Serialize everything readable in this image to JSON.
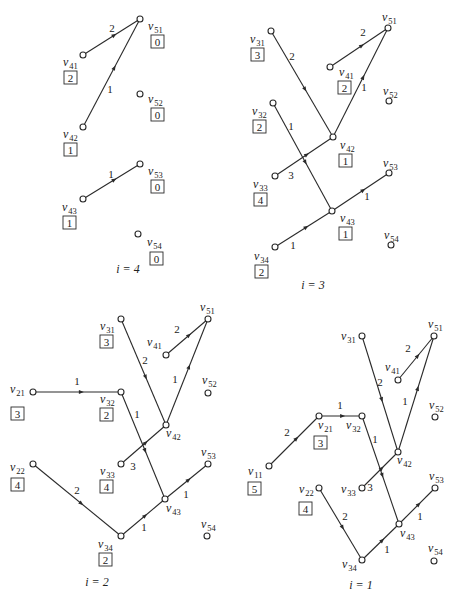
{
  "panels": [
    {
      "id": "i4",
      "caption": "i = 4",
      "caption_pos": [
        128,
        273
      ],
      "nodes": [
        {
          "name": "v51",
          "main": "v",
          "sub": "51",
          "x": 140,
          "y": 19,
          "lx": 148,
          "ly": 30,
          "value": "0",
          "bx": 151,
          "by": 35
        },
        {
          "name": "v41",
          "main": "v",
          "sub": "41",
          "x": 83,
          "y": 55,
          "lx": 63,
          "ly": 66,
          "value": "2",
          "bx": 64,
          "by": 71
        },
        {
          "name": "v52",
          "main": "v",
          "sub": "52",
          "x": 140,
          "y": 94,
          "lx": 148,
          "ly": 103,
          "value": "0",
          "bx": 151,
          "by": 108
        },
        {
          "name": "v42",
          "main": "v",
          "sub": "42",
          "x": 83,
          "y": 127,
          "lx": 63,
          "ly": 138,
          "value": "1",
          "bx": 64,
          "by": 143
        },
        {
          "name": "v53",
          "main": "v",
          "sub": "53",
          "x": 140,
          "y": 164,
          "lx": 148,
          "ly": 175,
          "value": "0",
          "bx": 151,
          "by": 180
        },
        {
          "name": "v43",
          "main": "v",
          "sub": "43",
          "x": 83,
          "y": 199,
          "lx": 62,
          "ly": 211,
          "value": "1",
          "bx": 63,
          "by": 216
        },
        {
          "name": "v54",
          "main": "v",
          "sub": "54",
          "x": 138,
          "y": 234,
          "lx": 147,
          "ly": 246,
          "value": "0",
          "bx": 150,
          "by": 252
        }
      ],
      "edges": [
        {
          "from": "v41",
          "to": "v51",
          "weight": "2",
          "wx": 112,
          "wy": 32
        },
        {
          "from": "v42",
          "to": "v51",
          "weight": "1",
          "wx": 110,
          "wy": 93
        },
        {
          "from": "v43",
          "to": "v53",
          "weight": "1",
          "wx": 111,
          "wy": 178
        }
      ]
    },
    {
      "id": "i3",
      "caption": "i = 3",
      "caption_pos": [
        313,
        289
      ],
      "nodes": [
        {
          "name": "v31",
          "main": "v",
          "sub": "31",
          "x": 271,
          "y": 31,
          "lx": 250,
          "ly": 43,
          "value": "3",
          "bx": 251,
          "by": 48
        },
        {
          "name": "v51",
          "main": "v",
          "sub": "51",
          "x": 388,
          "y": 28,
          "lx": 382,
          "ly": 21,
          "value": null
        },
        {
          "name": "v41",
          "main": "v",
          "sub": "41",
          "x": 330,
          "y": 67,
          "lx": 339,
          "ly": 76,
          "value": "2",
          "bx": 338,
          "by": 81
        },
        {
          "name": "v52",
          "main": "v",
          "sub": "52",
          "x": 389,
          "y": 101,
          "lx": 383,
          "ly": 95,
          "value": null
        },
        {
          "name": "v32",
          "main": "v",
          "sub": "32",
          "x": 273,
          "y": 103,
          "lx": 252,
          "ly": 115,
          "value": "2",
          "bx": 253,
          "by": 120
        },
        {
          "name": "v42",
          "main": "v",
          "sub": "42",
          "x": 333,
          "y": 137,
          "lx": 340,
          "ly": 149,
          "value": "1",
          "bx": 339,
          "by": 154
        },
        {
          "name": "v53",
          "main": "v",
          "sub": "53",
          "x": 389,
          "y": 173,
          "lx": 383,
          "ly": 167,
          "value": null
        },
        {
          "name": "v33",
          "main": "v",
          "sub": "33",
          "x": 275,
          "y": 176,
          "lx": 253,
          "ly": 188,
          "value": "4",
          "bx": 254,
          "by": 193
        },
        {
          "name": "v43",
          "main": "v",
          "sub": "43",
          "x": 332,
          "y": 211,
          "lx": 340,
          "ly": 222,
          "value": "1",
          "bx": 339,
          "by": 227
        },
        {
          "name": "v54",
          "main": "v",
          "sub": "54",
          "x": 391,
          "y": 245,
          "lx": 384,
          "ly": 239,
          "value": null
        },
        {
          "name": "v34",
          "main": "v",
          "sub": "34",
          "x": 275,
          "y": 247,
          "lx": 254,
          "ly": 260,
          "value": "2",
          "bx": 255,
          "by": 265
        }
      ],
      "edges": [
        {
          "from": "v31",
          "to": "v42",
          "weight": "2",
          "wx": 292,
          "wy": 60
        },
        {
          "from": "v41",
          "to": "v51",
          "weight": "2",
          "wx": 363,
          "wy": 36
        },
        {
          "from": "v42",
          "to": "v51",
          "weight": "1",
          "wx": 364,
          "wy": 91
        },
        {
          "from": "v32",
          "to": "v43",
          "weight": "1",
          "wx": 291,
          "wy": 130
        },
        {
          "from": "v33",
          "to": "v42",
          "weight": "3",
          "wx": 291,
          "wy": 179
        },
        {
          "from": "v43",
          "to": "v53",
          "weight": "1",
          "wx": 367,
          "wy": 200
        },
        {
          "from": "v34",
          "to": "v43",
          "weight": "1",
          "wx": 293,
          "wy": 249
        }
      ]
    },
    {
      "id": "i2",
      "caption": "i = 2",
      "caption_pos": [
        97,
        586
      ],
      "nodes": [
        {
          "name": "v51",
          "main": "v",
          "sub": "51",
          "x": 208,
          "y": 319,
          "lx": 200,
          "ly": 311,
          "value": null
        },
        {
          "name": "v31",
          "main": "v",
          "sub": "31",
          "x": 121,
          "y": 319,
          "lx": 100,
          "ly": 330,
          "value": "3",
          "bx": 100,
          "by": 335
        },
        {
          "name": "v41",
          "main": "v",
          "sub": "41",
          "x": 166,
          "y": 355,
          "lx": 147,
          "ly": 346,
          "value": null
        },
        {
          "name": "v21",
          "main": "v",
          "sub": "21",
          "x": 33,
          "y": 392,
          "lx": 10,
          "ly": 393,
          "value": "3",
          "bx": 11,
          "by": 407
        },
        {
          "name": "v32",
          "main": "v",
          "sub": "32",
          "x": 121,
          "y": 392,
          "lx": 100,
          "ly": 403,
          "value": "2",
          "bx": 100,
          "by": 408
        },
        {
          "name": "v52",
          "main": "v",
          "sub": "52",
          "x": 208,
          "y": 393,
          "lx": 202,
          "ly": 384,
          "value": null
        },
        {
          "name": "v42",
          "main": "v",
          "sub": "42",
          "x": 166,
          "y": 425,
          "lx": 166,
          "ly": 437,
          "value": null
        },
        {
          "name": "v22",
          "main": "v",
          "sub": "22",
          "x": 33,
          "y": 464,
          "lx": 10,
          "ly": 471,
          "value": "4",
          "bx": 11,
          "by": 478
        },
        {
          "name": "v33",
          "main": "v",
          "sub": "33",
          "x": 121,
          "y": 464,
          "lx": 100,
          "ly": 475,
          "value": "4",
          "bx": 100,
          "by": 480
        },
        {
          "name": "v53",
          "main": "v",
          "sub": "53",
          "x": 208,
          "y": 464,
          "lx": 201,
          "ly": 456,
          "value": null
        },
        {
          "name": "v43",
          "main": "v",
          "sub": "43",
          "x": 165,
          "y": 499,
          "lx": 166,
          "ly": 512,
          "value": null
        },
        {
          "name": "v34",
          "main": "v",
          "sub": "34",
          "x": 121,
          "y": 536,
          "lx": 98,
          "ly": 548,
          "value": "2",
          "bx": 99,
          "by": 553
        },
        {
          "name": "v54",
          "main": "v",
          "sub": "54",
          "x": 207,
          "y": 536,
          "lx": 201,
          "ly": 528,
          "value": null
        }
      ],
      "edges": [
        {
          "from": "v31",
          "to": "v42",
          "weight": "2",
          "wx": 145,
          "wy": 364
        },
        {
          "from": "v41",
          "to": "v51",
          "weight": "2",
          "wx": 177,
          "wy": 333
        },
        {
          "from": "v42",
          "to": "v51",
          "weight": "1",
          "wx": 175,
          "wy": 383
        },
        {
          "from": "v21",
          "to": "v32",
          "weight": "1",
          "wx": 77,
          "wy": 385
        },
        {
          "from": "v32",
          "to": "v43",
          "weight": "1",
          "wx": 137,
          "wy": 418
        },
        {
          "from": "v33",
          "to": "v42",
          "weight": "3",
          "wx": 133,
          "wy": 470
        },
        {
          "from": "v22",
          "to": "v34",
          "weight": "2",
          "wx": 77,
          "wy": 494
        },
        {
          "from": "v34",
          "to": "v43",
          "weight": "1",
          "wx": 144,
          "wy": 531
        },
        {
          "from": "v43",
          "to": "v53",
          "weight": "1",
          "wx": 186,
          "wy": 498
        }
      ]
    },
    {
      "id": "i1",
      "caption": "i = 1",
      "caption_pos": [
        361,
        589
      ],
      "nodes": [
        {
          "name": "v31",
          "main": "v",
          "sub": "31",
          "x": 362,
          "y": 336,
          "lx": 341,
          "ly": 340,
          "value": null
        },
        {
          "name": "v51",
          "main": "v",
          "sub": "51",
          "x": 434,
          "y": 336,
          "lx": 428,
          "ly": 328,
          "value": null
        },
        {
          "name": "v41",
          "main": "v",
          "sub": "41",
          "x": 398,
          "y": 380,
          "lx": 385,
          "ly": 371,
          "value": null
        },
        {
          "name": "v21",
          "main": "v",
          "sub": "21",
          "x": 319,
          "y": 416,
          "lx": 318,
          "ly": 429,
          "value": "3",
          "bx": 314,
          "by": 436
        },
        {
          "name": "v32",
          "main": "v",
          "sub": "32",
          "x": 362,
          "y": 416,
          "lx": 346,
          "ly": 429,
          "value": null
        },
        {
          "name": "v52",
          "main": "v",
          "sub": "52",
          "x": 435,
          "y": 417,
          "lx": 429,
          "ly": 409,
          "value": null
        },
        {
          "name": "v42",
          "main": "v",
          "sub": "42",
          "x": 398,
          "y": 452,
          "lx": 397,
          "ly": 464,
          "value": null
        },
        {
          "name": "v11",
          "main": "v",
          "sub": "11",
          "x": 269,
          "y": 466,
          "lx": 248,
          "ly": 475,
          "value": "5",
          "bx": 248,
          "by": 482
        },
        {
          "name": "v22",
          "main": "v",
          "sub": "22",
          "x": 319,
          "y": 488,
          "lx": 299,
          "ly": 493,
          "value": "4",
          "bx": 299,
          "by": 502
        },
        {
          "name": "v33",
          "main": "v",
          "sub": "33",
          "x": 362,
          "y": 488,
          "lx": 341,
          "ly": 493,
          "value": null
        },
        {
          "name": "v53",
          "main": "v",
          "sub": "53",
          "x": 435,
          "y": 488,
          "lx": 429,
          "ly": 480,
          "value": null
        },
        {
          "name": "v43",
          "main": "v",
          "sub": "43",
          "x": 399,
          "y": 524,
          "lx": 400,
          "ly": 537,
          "value": null
        },
        {
          "name": "v34",
          "main": "v",
          "sub": "34",
          "x": 362,
          "y": 560,
          "lx": 342,
          "ly": 568,
          "value": null
        },
        {
          "name": "v54",
          "main": "v",
          "sub": "54",
          "x": 434,
          "y": 561,
          "lx": 428,
          "ly": 552,
          "value": null
        }
      ],
      "edges": [
        {
          "from": "v31",
          "to": "v42",
          "weight": "2",
          "wx": 380,
          "wy": 386
        },
        {
          "from": "v41",
          "to": "v51",
          "weight": "2",
          "wx": 408,
          "wy": 352
        },
        {
          "from": "v42",
          "to": "v51",
          "weight": "1",
          "wx": 405,
          "wy": 405
        },
        {
          "from": "v11",
          "to": "v21",
          "weight": "2",
          "wx": 287,
          "wy": 436
        },
        {
          "from": "v21",
          "to": "v32",
          "weight": "1",
          "wx": 340,
          "wy": 409
        },
        {
          "from": "v32",
          "to": "v43",
          "weight": "1",
          "wx": 375,
          "wy": 443
        },
        {
          "from": "v33",
          "to": "v42",
          "weight": "3",
          "wx": 370,
          "wy": 491
        },
        {
          "from": "v22",
          "to": "v34",
          "weight": "2",
          "wx": 345,
          "wy": 520
        },
        {
          "from": "v34",
          "to": "v43",
          "weight": "1",
          "wx": 387,
          "wy": 553
        },
        {
          "from": "v43",
          "to": "v53",
          "weight": "1",
          "wx": 420,
          "wy": 520
        }
      ]
    }
  ],
  "style": {
    "line_color": "#2a2a2a",
    "background": "#ffffff"
  }
}
